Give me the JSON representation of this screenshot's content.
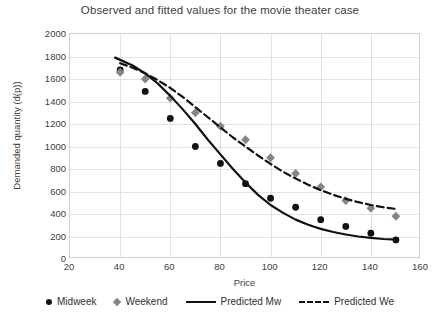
{
  "chart_data": {
    "type": "scatter",
    "title": "Observed and fitted values for the movie theater case",
    "xlabel": "Price",
    "ylabel": "Demanded quantity (d(p))",
    "xlim": [
      20,
      160
    ],
    "ylim": [
      0,
      2000
    ],
    "xticks": [
      20,
      40,
      60,
      80,
      100,
      120,
      140,
      160
    ],
    "yticks": [
      0,
      200,
      400,
      600,
      800,
      1000,
      1200,
      1400,
      1600,
      1800,
      2000
    ],
    "grid": true,
    "legend_position": "bottom",
    "x": [
      40,
      50,
      60,
      70,
      80,
      90,
      100,
      110,
      120,
      130,
      140,
      150
    ],
    "series": [
      {
        "name": "Midweek",
        "style": "scatter-circle",
        "color": "#101010",
        "values": [
          1680,
          1490,
          1250,
          1000,
          850,
          670,
          540,
          460,
          350,
          290,
          230,
          170
        ]
      },
      {
        "name": "Weekend",
        "style": "scatter-diamond",
        "color": "#858585",
        "values": [
          1660,
          1600,
          1430,
          1300,
          1180,
          1060,
          900,
          760,
          640,
          520,
          450,
          380
        ]
      },
      {
        "name": "Predicted Mw",
        "style": "line-solid",
        "color": "#111111",
        "x": [
          38,
          45,
          50,
          55,
          60,
          65,
          70,
          75,
          80,
          85,
          90,
          95,
          100,
          105,
          110,
          115,
          120,
          125,
          130,
          135,
          140,
          145,
          150
        ],
        "values": [
          1790,
          1720,
          1650,
          1560,
          1450,
          1330,
          1200,
          1060,
          930,
          800,
          680,
          570,
          480,
          410,
          350,
          305,
          268,
          240,
          218,
          200,
          188,
          178,
          172
        ]
      },
      {
        "name": "Predicted We",
        "style": "line-dashed",
        "color": "#111111",
        "x": [
          40,
          45,
          50,
          55,
          60,
          65,
          70,
          75,
          80,
          85,
          90,
          95,
          100,
          105,
          110,
          115,
          120,
          125,
          130,
          135,
          140,
          145,
          150
        ],
        "values": [
          1740,
          1700,
          1650,
          1590,
          1520,
          1440,
          1350,
          1260,
          1170,
          1080,
          1000,
          920,
          845,
          775,
          715,
          660,
          612,
          570,
          535,
          505,
          480,
          460,
          445
        ]
      }
    ]
  },
  "legend": {
    "items": [
      {
        "label": "Midweek",
        "marker": "circle-marker-icon"
      },
      {
        "label": "Weekend",
        "marker": "diamond-marker-icon"
      },
      {
        "label": "Predicted Mw",
        "marker": "solid-line-icon"
      },
      {
        "label": "Predicted We",
        "marker": "dashed-line-icon"
      }
    ]
  }
}
